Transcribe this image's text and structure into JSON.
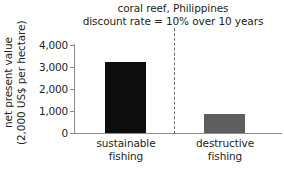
{
  "chart_data": {
    "type": "bar",
    "title": "coral reef, Philippines",
    "subtitle": "discount rate = 10% over 10 years",
    "title_lines": [
      "coral reef, Philippines",
      "discount rate = 10% over 10 years"
    ],
    "xlabel": "",
    "ylabel": "net present value (2,000 US$ per hectare)",
    "ylabel_lines": [
      "net present value",
      "(2,000 US$ per hectare)"
    ],
    "categories": [
      "sustainable fishing",
      "destructive fishing"
    ],
    "category_lines": [
      [
        "sustainable",
        "fishing"
      ],
      [
        "destructive",
        "fishing"
      ]
    ],
    "values": [
      3230,
      880
    ],
    "ylim": [
      0,
      4000
    ],
    "yticks": [
      0,
      1000,
      2000,
      3000,
      4000
    ],
    "ytick_labels": [
      "0",
      "1,000",
      "2,000",
      "3,000",
      "4,000"
    ],
    "grid": false,
    "legend": null,
    "bar_colors": [
      "#0d0d0d",
      "#5e5e5e"
    ],
    "axis_color": "#8d8d8d",
    "divider": {
      "style": "dashed",
      "color": "#6e6e6e",
      "between": [
        "sustainable fishing",
        "destructive fishing"
      ]
    }
  }
}
